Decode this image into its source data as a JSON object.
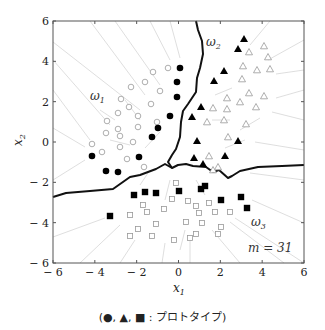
{
  "figure": {
    "caption": "(●, ▲, ■ : プロトタイプ)",
    "m_label": "m = 31",
    "x_axis": {
      "label": "x",
      "sub": "1",
      "ticks": [
        "− 6",
        "− 4",
        "− 2",
        "0",
        "2",
        "4",
        "6"
      ]
    },
    "y_axis": {
      "label": "x",
      "sub": "2",
      "ticks": [
        "6",
        "4",
        "2",
        "0",
        "− 2",
        "− 4",
        "− 6"
      ]
    },
    "regions": [
      {
        "label": "ω",
        "sub": "1",
        "x": 98,
        "y": 100
      },
      {
        "label": "ω",
        "sub": "2",
        "x": 206,
        "y": 46
      },
      {
        "label": "ω",
        "sub": "3",
        "x": 251,
        "y": 225
      }
    ]
  },
  "chart_data": {
    "type": "scatter",
    "title": "",
    "xlabel": "x1",
    "ylabel": "x2",
    "xlim": [
      -6,
      6
    ],
    "ylim": [
      -6,
      6
    ],
    "annotation": "m = 31",
    "legend": "(●, ▲, ■ : prototypes)",
    "series": [
      {
        "name": "ω1 prototypes",
        "marker": "filled-circle",
        "points": [
          [
            0.1,
            3.6
          ],
          [
            -0.1,
            2.9
          ],
          [
            -0.1,
            2.2
          ],
          [
            -0.4,
            1.3
          ],
          [
            -1.0,
            0.7
          ],
          [
            -1.3,
            0.2
          ],
          [
            -4.1,
            -0.7
          ],
          [
            -1.9,
            -0.7
          ],
          [
            -3.4,
            -1.4
          ],
          [
            -2.9,
            -1.5
          ]
        ]
      },
      {
        "name": "ω2 prototypes",
        "marker": "filled-triangle",
        "points": [
          [
            3.1,
            5.1
          ],
          [
            2.8,
            4.6
          ],
          [
            2.2,
            3.5
          ],
          [
            1.7,
            2.9
          ],
          [
            1.1,
            1.7
          ],
          [
            0.7,
            1.2
          ],
          [
            0.9,
            0.0
          ],
          [
            2.9,
            0.0
          ],
          [
            0.7,
            -0.8
          ],
          [
            2.2,
            -0.7
          ],
          [
            1.2,
            -1.1
          ]
        ]
      },
      {
        "name": "ω3 prototypes",
        "marker": "filled-square",
        "points": [
          [
            -2.1,
            -2.6
          ],
          [
            -1.6,
            -2.5
          ],
          [
            -1.0,
            -2.5
          ],
          [
            0.0,
            -2.4
          ],
          [
            0.8,
            -2.3
          ],
          [
            1.2,
            -2.2
          ],
          [
            2.0,
            -2.9
          ],
          [
            3.0,
            -2.7
          ],
          [
            3.3,
            -3.3
          ],
          [
            -3.3,
            -3.7
          ]
        ]
      },
      {
        "name": "ω1 samples",
        "marker": "open-circle"
      },
      {
        "name": "ω2 samples",
        "marker": "open-triangle"
      },
      {
        "name": "ω3 samples",
        "marker": "open-square"
      }
    ]
  },
  "plot": {
    "frame": {
      "left": 53,
      "top": 21,
      "right": 304,
      "bottom": 263
    },
    "filled_circles": [
      [
        180,
        68
      ],
      [
        177,
        82
      ],
      [
        177,
        97
      ],
      [
        170,
        116
      ],
      [
        158,
        128
      ],
      [
        152,
        137
      ],
      [
        92,
        156
      ],
      [
        139,
        157
      ],
      [
        106,
        171
      ],
      [
        118,
        172
      ]
    ],
    "filled_triangles": [
      [
        244,
        39
      ],
      [
        238,
        49
      ],
      [
        224,
        71
      ],
      [
        214,
        81
      ],
      [
        201,
        107
      ],
      [
        192,
        117
      ],
      [
        197,
        141
      ],
      [
        238,
        141
      ],
      [
        194,
        158
      ],
      [
        225,
        156
      ],
      [
        203,
        164
      ]
    ],
    "filled_squares": [
      [
        134,
        195
      ],
      [
        145,
        192
      ],
      [
        156,
        193
      ],
      [
        179,
        191
      ],
      [
        201,
        189
      ],
      [
        205,
        186
      ],
      [
        221,
        200
      ],
      [
        241,
        197
      ],
      [
        247,
        208
      ],
      [
        110,
        216
      ]
    ],
    "open_circles": [
      [
        168,
        68
      ],
      [
        153,
        72
      ],
      [
        145,
        82
      ],
      [
        131,
        87
      ],
      [
        160,
        91
      ],
      [
        121,
        99
      ],
      [
        129,
        107
      ],
      [
        151,
        104
      ],
      [
        118,
        113
      ],
      [
        138,
        116
      ],
      [
        157,
        122
      ],
      [
        107,
        121
      ],
      [
        118,
        129
      ],
      [
        138,
        127
      ],
      [
        106,
        133
      ],
      [
        120,
        136
      ],
      [
        92,
        144
      ],
      [
        133,
        142
      ],
      [
        102,
        152
      ],
      [
        120,
        147
      ],
      [
        127,
        159
      ],
      [
        144,
        167
      ]
    ],
    "open_triangles": [
      [
        264,
        46
      ],
      [
        249,
        52
      ],
      [
        268,
        57
      ],
      [
        243,
        66
      ],
      [
        257,
        70
      ],
      [
        270,
        69
      ],
      [
        242,
        79
      ],
      [
        227,
        98
      ],
      [
        249,
        93
      ],
      [
        264,
        96
      ],
      [
        213,
        108
      ],
      [
        207,
        122
      ],
      [
        227,
        109
      ],
      [
        240,
        102
      ],
      [
        256,
        107
      ],
      [
        224,
        120
      ],
      [
        246,
        124
      ],
      [
        228,
        137
      ],
      [
        209,
        156
      ],
      [
        218,
        167
      ],
      [
        213,
        170
      ]
    ],
    "open_squares": [
      [
        176,
        183
      ],
      [
        172,
        199
      ],
      [
        188,
        201
      ],
      [
        209,
        203
      ],
      [
        196,
        206
      ],
      [
        143,
        205
      ],
      [
        130,
        215
      ],
      [
        147,
        212
      ],
      [
        164,
        209
      ],
      [
        199,
        213
      ],
      [
        215,
        212
      ],
      [
        230,
        212
      ],
      [
        156,
        224
      ],
      [
        186,
        222
      ],
      [
        202,
        223
      ],
      [
        221,
        227
      ],
      [
        138,
        229
      ],
      [
        130,
        236
      ],
      [
        152,
        236
      ],
      [
        174,
        240
      ],
      [
        190,
        238
      ],
      [
        196,
        234
      ],
      [
        218,
        234
      ]
    ],
    "boundaries": [
      [
        [
          196,
          21
        ],
        [
          198,
          30
        ],
        [
          202,
          41
        ],
        [
          203,
          54
        ],
        [
          200,
          68
        ],
        [
          197,
          78
        ],
        [
          196,
          92
        ],
        [
          188,
          104
        ],
        [
          183,
          111
        ],
        [
          181,
          122
        ],
        [
          180,
          137
        ],
        [
          176,
          149
        ],
        [
          172,
          155
        ],
        [
          168,
          162
        ],
        [
          172,
          168
        ],
        [
          178,
          165
        ],
        [
          186,
          164
        ],
        [
          193,
          166
        ],
        [
          206,
          167
        ],
        [
          213,
          172
        ],
        [
          219,
          170
        ],
        [
          228,
          178
        ],
        [
          232,
          176
        ],
        [
          240,
          171
        ],
        [
          258,
          167
        ],
        [
          282,
          166
        ],
        [
          304,
          165
        ]
      ],
      [
        [
          53,
          197
        ],
        [
          66,
          193
        ],
        [
          90,
          191
        ],
        [
          113,
          189
        ],
        [
          130,
          177
        ],
        [
          140,
          175
        ],
        [
          148,
          172
        ],
        [
          156,
          169
        ],
        [
          165,
          164
        ],
        [
          172,
          168
        ]
      ]
    ],
    "voronoi_edges": [
      [
        [
          53,
          42
        ],
        [
          140,
          110
        ]
      ],
      [
        [
          53,
          60
        ],
        [
          110,
          125
        ]
      ],
      [
        [
          53,
          90
        ],
        [
          90,
          140
        ]
      ],
      [
        [
          53,
          128
        ],
        [
          85,
          147
        ]
      ],
      [
        [
          53,
          180
        ],
        [
          85,
          160
        ]
      ],
      [
        [
          90,
          21
        ],
        [
          145,
          95
        ]
      ],
      [
        [
          115,
          21
        ],
        [
          160,
          85
        ]
      ],
      [
        [
          150,
          21
        ],
        [
          170,
          60
        ]
      ],
      [
        [
          170,
          21
        ],
        [
          180,
          58
        ]
      ],
      [
        [
          270,
          21
        ],
        [
          250,
          45
        ]
      ],
      [
        [
          304,
          40
        ],
        [
          268,
          60
        ]
      ],
      [
        [
          304,
          70
        ],
        [
          276,
          74
        ]
      ],
      [
        [
          304,
          90
        ],
        [
          276,
          98
        ]
      ],
      [
        [
          304,
          120
        ],
        [
          272,
          112
        ]
      ],
      [
        [
          304,
          150
        ],
        [
          255,
          142
        ]
      ],
      [
        [
          304,
          180
        ],
        [
          250,
          173
        ]
      ],
      [
        [
          304,
          223
        ],
        [
          252,
          200
        ]
      ],
      [
        [
          304,
          263
        ],
        [
          235,
          218
        ]
      ],
      [
        [
          284,
          263
        ],
        [
          230,
          222
        ]
      ],
      [
        [
          240,
          263
        ],
        [
          212,
          230
        ]
      ],
      [
        [
          190,
          263
        ],
        [
          190,
          240
        ]
      ],
      [
        [
          162,
          263
        ],
        [
          165,
          243
        ]
      ],
      [
        [
          120,
          263
        ],
        [
          135,
          240
        ]
      ],
      [
        [
          80,
          263
        ],
        [
          120,
          225
        ]
      ],
      [
        [
          53,
          237
        ],
        [
          105,
          218
        ]
      ],
      [
        [
          150,
          170
        ],
        [
          140,
          185
        ]
      ],
      [
        [
          196,
          180
        ],
        [
          205,
          195
        ]
      ],
      [
        [
          170,
          180
        ],
        [
          165,
          200
        ]
      ],
      [
        [
          185,
          230
        ],
        [
          180,
          250
        ]
      ],
      [
        [
          212,
          120
        ],
        [
          230,
          120
        ]
      ],
      [
        [
          215,
          95
        ],
        [
          232,
          88
        ]
      ],
      [
        [
          240,
          130
        ],
        [
          260,
          118
        ]
      ],
      [
        [
          225,
          148
        ],
        [
          245,
          140
        ]
      ],
      [
        [
          125,
          100
        ],
        [
          140,
          120
        ]
      ],
      [
        [
          110,
          140
        ],
        [
          130,
          145
        ]
      ],
      [
        [
          145,
          148
        ],
        [
          160,
          132
        ]
      ],
      [
        [
          100,
          110
        ],
        [
          115,
          120
        ]
      ]
    ]
  }
}
